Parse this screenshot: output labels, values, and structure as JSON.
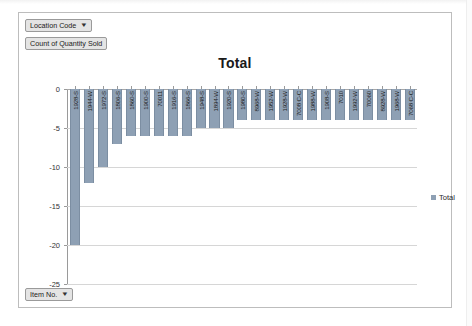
{
  "window": {
    "type": "excel-pivotchart"
  },
  "pivot_controls": {
    "filter_field": {
      "label": "Location Code",
      "caret": "▼"
    },
    "value_field": {
      "label": "Count of Quantity Sold"
    },
    "axis_field": {
      "label": "Item No.",
      "caret": "▼"
    }
  },
  "legend": {
    "position": "right",
    "entries": [
      {
        "label": "Total",
        "color": "#8ea0b4"
      }
    ]
  },
  "colors": {
    "series": "#8ea0b4",
    "gridline": "#d6d6d6",
    "axis": "#9a9a9a",
    "frame": "#bdbdbd",
    "button_face": "#e4e4e4"
  },
  "chart_data": {
    "type": "bar",
    "title": "Total",
    "xlabel": "",
    "ylabel": "",
    "ylim": [
      -25,
      0
    ],
    "yticks": [
      0,
      -5,
      -10,
      -15,
      -20,
      -25
    ],
    "ytick_labels": [
      "0",
      "-5",
      "-10",
      "-15",
      "-20",
      "-25"
    ],
    "grid": true,
    "legend_position": "right",
    "categories": [
      "1928-S",
      "1944-W",
      "1972-S",
      "1806-S",
      "1860-S",
      "1900-S",
      "70011",
      "1916-S",
      "1866-S",
      "1948-S",
      "1894-W",
      "1920-S",
      "1980-S",
      "8968-W",
      "1952-W",
      "1928-W",
      "7008 C-C",
      "1988-W",
      "1908-S",
      "7010",
      "1992-W",
      "70060",
      "8928-W",
      "1968-W",
      "7068 C-C"
    ],
    "series": [
      {
        "name": "Total",
        "values": [
          -20,
          -12,
          -10,
          -7,
          -6,
          -6,
          -6,
          -6,
          -6,
          -5,
          -5,
          -5,
          -4,
          -4,
          -4,
          -4,
          -4,
          -4,
          -4,
          -4,
          -4,
          -4,
          -4,
          -4,
          -4
        ]
      }
    ]
  }
}
